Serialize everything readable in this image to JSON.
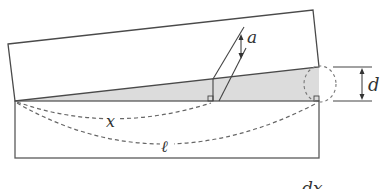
{
  "diagram": {
    "labels": {
      "angle": "a",
      "thickness": "d",
      "position": "x",
      "length": "ℓ",
      "bottom_caption": "dx"
    },
    "colors": {
      "stroke": "#555555",
      "wedge_fill": "#d9d9d9",
      "dashed": "#666666",
      "background": "#ffffff"
    }
  }
}
